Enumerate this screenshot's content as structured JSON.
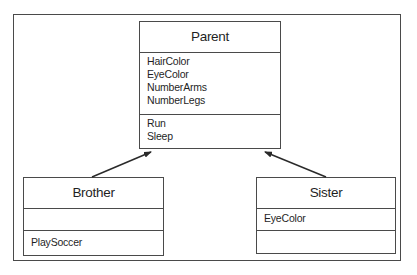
{
  "diagram": {
    "type": "UML class inheritance diagram",
    "classes": {
      "parent": {
        "name": "Parent",
        "attributes": [
          "HairColor",
          "EyeColor",
          "NumberArms",
          "NumberLegs"
        ],
        "methods": [
          "Run",
          "Sleep"
        ]
      },
      "brother": {
        "name": "Brother",
        "attributes": [],
        "methods": [
          "PlaySoccer"
        ]
      },
      "sister": {
        "name": "Sister",
        "attributes": [
          "EyeColor"
        ],
        "methods": []
      }
    },
    "relationships": [
      {
        "from": "Brother",
        "to": "Parent",
        "type": "inherits"
      },
      {
        "from": "Sister",
        "to": "Parent",
        "type": "inherits"
      }
    ],
    "colors": {
      "line": "#4a4a4a",
      "text": "#1f1f1f",
      "background": "#ffffff"
    }
  }
}
